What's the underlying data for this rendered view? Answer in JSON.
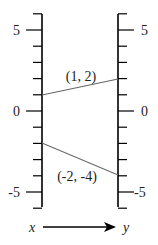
{
  "diagram": {
    "type": "mapping-diagram",
    "left_axis": {
      "label": "x",
      "range": [
        -6,
        6
      ],
      "labeled_ticks": [
        {
          "value": 5,
          "label": "5"
        },
        {
          "value": 0,
          "label": "0"
        },
        {
          "value": -5,
          "label": "-5"
        }
      ]
    },
    "right_axis": {
      "label": "y",
      "range": [
        -6,
        6
      ],
      "labeled_ticks": [
        {
          "value": 5,
          "label": "5"
        },
        {
          "value": 0,
          "label": "0"
        },
        {
          "value": -5,
          "label": "-5"
        }
      ]
    },
    "mappings": [
      {
        "from": 1,
        "to": 2,
        "label": "(1, 2)"
      },
      {
        "from": -2,
        "to": -4,
        "label": "(-2, -4)"
      }
    ],
    "arrow": {
      "from_label": "x",
      "to_label": "y"
    },
    "colors": {
      "axis": "#000000",
      "mapping_line": "#666666"
    }
  }
}
